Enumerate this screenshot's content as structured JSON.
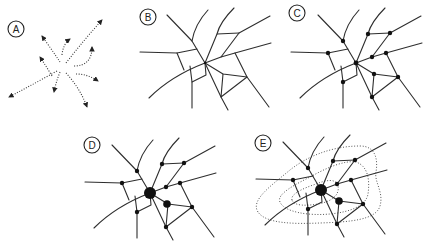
{
  "figure": {
    "colors": {
      "line": "#2e2e2e",
      "node": "#111111",
      "background": "#ffffff"
    },
    "panels": [
      {
        "id": "A",
        "label": "A",
        "content": "dotted arrows radiating from a central point (movement flows)"
      },
      {
        "id": "B",
        "label": "B",
        "content": "network of routes, no nodes"
      },
      {
        "id": "C",
        "label": "C",
        "content": "network with equal-size nodes at intersections"
      },
      {
        "id": "D",
        "label": "D",
        "content": "network with one large central node and one medium node"
      },
      {
        "id": "E",
        "label": "E",
        "content": "network of D with nested dotted contour zones"
      }
    ]
  }
}
